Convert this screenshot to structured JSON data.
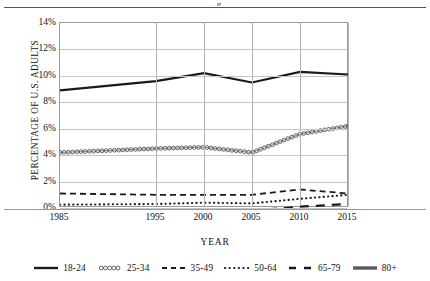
{
  "figure": {
    "top_glyph": "g",
    "axis_title_y": "PERCENTAGE OF U.S. ADULTS",
    "axis_title_x": "YEAR"
  },
  "chart_data": {
    "type": "line",
    "title": "",
    "xlabel": "YEAR",
    "ylabel": "PERCENTAGE OF U.S. ADULTS",
    "x": [
      1985,
      1995,
      2000,
      2005,
      2010,
      2015
    ],
    "xticklabels": [
      "1985",
      "1995",
      "2000",
      "2005",
      "2010",
      "2015"
    ],
    "yticklabels": [
      "0%",
      "2%",
      "4%",
      "6%",
      "8%",
      "10%",
      "12%",
      "14%"
    ],
    "yticks": [
      0,
      2,
      4,
      6,
      8,
      10,
      12,
      14
    ],
    "ylim": [
      0,
      14
    ],
    "xlim": [
      1985,
      2015
    ],
    "grid": true,
    "legend_position": "bottom",
    "series": [
      {
        "name": "18-24",
        "style": "solid-thick",
        "color": "#1a1a1a",
        "values": [
          8.9,
          9.6,
          10.2,
          9.5,
          10.3,
          10.1
        ]
      },
      {
        "name": "25-34",
        "style": "circle-markers",
        "color": "#555555",
        "values": [
          4.2,
          4.5,
          4.6,
          4.2,
          5.6,
          6.2
        ]
      },
      {
        "name": "35-49",
        "style": "dashed",
        "color": "#1a1a1a",
        "values": [
          1.1,
          1.0,
          1.0,
          1.0,
          1.4,
          1.1
        ]
      },
      {
        "name": "50-64",
        "style": "dotted",
        "color": "#1a1a1a",
        "values": [
          0.25,
          0.3,
          0.4,
          0.35,
          0.7,
          1.0
        ]
      },
      {
        "name": "65-79",
        "style": "long-dash",
        "color": "#1a1a1a",
        "values": [
          -0.35,
          -0.3,
          -0.25,
          -0.2,
          0.1,
          0.3
        ]
      },
      {
        "name": "80+",
        "style": "thick-gray",
        "color": "#5a5a5a",
        "values": [
          -0.55,
          -0.5,
          -0.45,
          -0.4,
          -0.3,
          -0.25
        ]
      }
    ],
    "legend": [
      {
        "label": "18-24",
        "key": "solid-thick"
      },
      {
        "label": "25-34",
        "key": "circle-markers"
      },
      {
        "label": "35-49",
        "key": "dashed"
      },
      {
        "label": "50-64",
        "key": "dotted"
      },
      {
        "label": "65-79",
        "key": "long-dash"
      },
      {
        "label": "80+",
        "key": "thick-gray"
      }
    ]
  }
}
